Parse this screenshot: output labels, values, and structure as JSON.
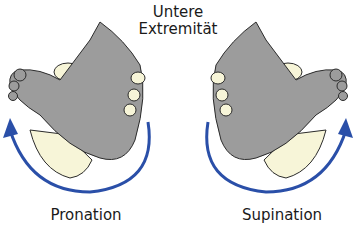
{
  "title": {
    "line1": "Untere",
    "line2": "Extremität"
  },
  "panels": [
    {
      "label": "Pronation",
      "arrow_direction": "counterclockwise",
      "arrow_side": "left"
    },
    {
      "label": "Supination",
      "arrow_direction": "clockwise",
      "arrow_side": "right"
    }
  ],
  "colors": {
    "foot": "#9c9c9c",
    "hand": "#f7f5d8",
    "arrow": "#2a4fa8",
    "outline": "#2b2b2b"
  }
}
